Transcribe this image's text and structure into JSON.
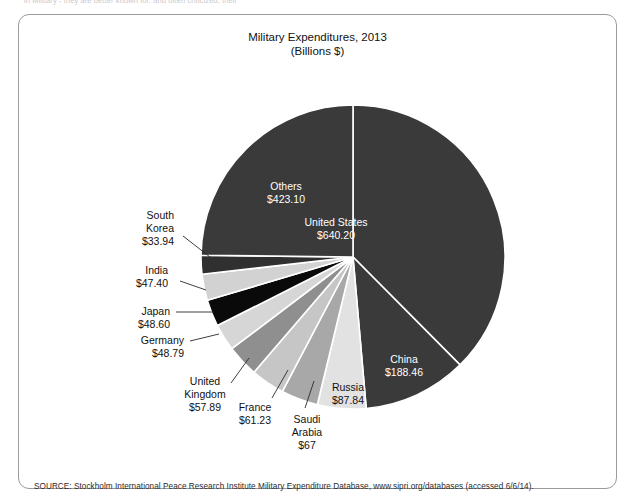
{
  "top_cutoff_text": "in Military - they are better known for, and often criticized, their",
  "figure": {
    "title_line1": "Military Expenditures, 2013",
    "title_line2": "(Billions $)",
    "source": "SOURCE: Stockholm International Peace Research Institute Military Expenditure Database, www.sipri.org/databases (accessed 6/6/14).",
    "border_color": "#9b9b9b"
  },
  "chart_data": {
    "type": "pie",
    "title": "Military Expenditures, 2013",
    "subtitle": "(Billions $)",
    "unit": "Billions of US dollars",
    "year": 2013,
    "total": 1704.45,
    "start_angle_deg": 0,
    "direction": "clockwise",
    "legend": "none (direct labels)",
    "categories": [
      "United States",
      "China",
      "Russia",
      "Saudi Arabia",
      "France",
      "United Kingdom",
      "Germany",
      "Japan",
      "India",
      "South Korea",
      "Others"
    ],
    "values": [
      640.2,
      188.46,
      87.84,
      67,
      61.23,
      57.89,
      48.79,
      48.6,
      47.4,
      33.94,
      423.1
    ],
    "slices": [
      {
        "label": "United States",
        "value_text": "$640.20",
        "value": 640.2,
        "color": "#3a3a3a",
        "label_placement": "inside",
        "label_color": "#ffffff"
      },
      {
        "label": "China",
        "value_text": "$188.46",
        "value": 188.46,
        "color": "#3a3a3a",
        "label_placement": "inside",
        "label_color": "#ffffff"
      },
      {
        "label": "Russia",
        "value_text": "$87.84",
        "value": 87.84,
        "color": "#e2e2e2",
        "label_placement": "inside",
        "label_color": "#111111"
      },
      {
        "label": "Saudi Arabia",
        "value_text": "$67",
        "value": 67,
        "color": "#a8a8a8",
        "label_placement": "outside",
        "label_color": "#111111"
      },
      {
        "label": "France",
        "value_text": "$61.23",
        "value": 61.23,
        "color": "#c6c6c6",
        "label_placement": "outside",
        "label_color": "#111111"
      },
      {
        "label": "United Kingdom",
        "value_text": "$57.89",
        "value": 57.89,
        "color": "#8f8f8f",
        "label_placement": "outside",
        "label_color": "#111111"
      },
      {
        "label": "Germany",
        "value_text": "$48.79",
        "value": 48.79,
        "color": "#d6d6d6",
        "label_placement": "outside",
        "label_color": "#111111"
      },
      {
        "label": "Japan",
        "value_text": "$48.60",
        "value": 48.6,
        "color": "#0a0a0a",
        "label_placement": "outside",
        "label_color": "#111111"
      },
      {
        "label": "India",
        "value_text": "$47.40",
        "value": 47.4,
        "color": "#d2d2d2",
        "label_placement": "outside",
        "label_color": "#111111"
      },
      {
        "label": "South Korea",
        "value_text": "$33.94",
        "value": 33.94,
        "color": "#303030",
        "label_placement": "outside",
        "label_color": "#111111"
      },
      {
        "label": "Others",
        "value_text": "$423.10",
        "value": 423.1,
        "color": "#3a3a3a",
        "label_placement": "inside",
        "label_color": "#ffffff"
      }
    ]
  },
  "labels": {
    "united_states": {
      "name": "United States",
      "value": "$640.20"
    },
    "china": {
      "name": "China",
      "value": "$188.46"
    },
    "russia": {
      "name": "Russia",
      "value": "$87.84"
    },
    "saudi_arabia": {
      "name": "Saudi",
      "name2": "Arabia",
      "value": "$67"
    },
    "france": {
      "name": "France",
      "value": "$61.23"
    },
    "united_kingdom": {
      "name": "United",
      "name2": "Kingdom",
      "value": "$57.89"
    },
    "germany": {
      "name": "Germany",
      "value": "$48.79"
    },
    "japan": {
      "name": "Japan",
      "value": "$48.60"
    },
    "india": {
      "name": "India",
      "value": "$47.40"
    },
    "south_korea": {
      "name": "South",
      "name2": "Korea",
      "value": "$33.94"
    },
    "others": {
      "name": "Others",
      "value": "$423.10"
    }
  }
}
